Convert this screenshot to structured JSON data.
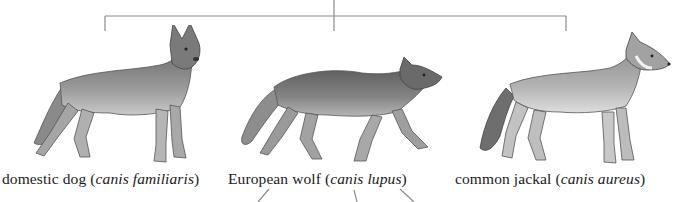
{
  "diagram": {
    "tree": {
      "root_x": 334,
      "branch_y": 16,
      "leaf_xs": [
        105,
        566
      ],
      "line_color": "#8a8a8a"
    },
    "species": [
      {
        "common_name": "domestic dog",
        "scientific_name": "canis familiaris",
        "illustration": "german-shepherd-dog-standing"
      },
      {
        "common_name": "European wolf",
        "scientific_name": "canis lupus",
        "illustration": "wolf-walking-snarling"
      },
      {
        "common_name": "common jackal",
        "scientific_name": "canis aureus",
        "illustration": "jackal-standing"
      }
    ],
    "paren_open": "(",
    "paren_close": ")"
  }
}
